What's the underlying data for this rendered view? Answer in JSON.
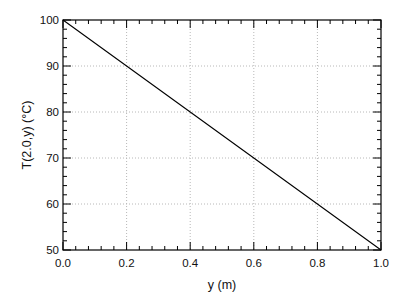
{
  "chart_data": {
    "type": "line",
    "title": "",
    "xlabel": "y (m)",
    "ylabel": "T(2.0,y) (°C)",
    "xlim": [
      0.0,
      1.0
    ],
    "ylim": [
      50,
      100
    ],
    "x_ticks": [
      "0.0",
      "0.2",
      "0.4",
      "0.6",
      "0.8",
      "1.0"
    ],
    "y_ticks": [
      "50",
      "60",
      "70",
      "80",
      "90",
      "100"
    ],
    "x_minor_per_major": 5,
    "y_minor_per_major": 5,
    "grid": true,
    "grid_style": "dotted",
    "legend": null,
    "series": [
      {
        "name": "T(2.0,y)",
        "color": "#000000",
        "x": [
          0.0,
          0.2,
          0.4,
          0.6,
          0.8,
          1.0
        ],
        "values": [
          100,
          90,
          80,
          70,
          60,
          50
        ]
      }
    ]
  },
  "colors": {
    "axis": "#000000",
    "grid": "#b8b8b8",
    "line": "#000000",
    "background": "#ffffff"
  }
}
